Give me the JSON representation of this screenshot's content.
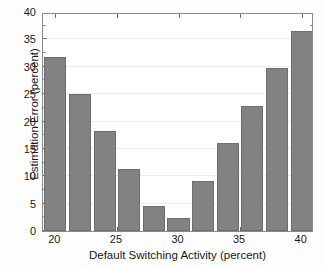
{
  "chart_data": {
    "type": "bar",
    "title": "",
    "xlabel": "Default Switching Activity (percent)",
    "ylabel": "Estimation Error (percent)",
    "x": [
      20,
      22,
      24,
      26,
      28,
      30,
      32,
      34,
      36,
      38,
      40
    ],
    "categories": [
      "20",
      "22",
      "24",
      "26",
      "28",
      "30",
      "32",
      "34",
      "36",
      "38",
      "40"
    ],
    "values": [
      31.8,
      25.0,
      18.3,
      11.4,
      4.6,
      2.4,
      9.2,
      16.1,
      22.9,
      29.7,
      36.5
    ],
    "xlim": [
      19,
      41
    ],
    "ylim": [
      0,
      40
    ],
    "xticks": [
      20,
      25,
      30,
      35,
      40
    ],
    "xtick_labels": [
      "20",
      "25",
      "30",
      "35",
      "40"
    ],
    "yticks": [
      0,
      5,
      10,
      15,
      20,
      25,
      30,
      35,
      40
    ],
    "ytick_labels": [
      "0",
      "5",
      "10",
      "15",
      "20",
      "25",
      "30",
      "35",
      "40"
    ],
    "grid": "horizontal",
    "legend": "none",
    "bar_color": "#828282",
    "bar_edge_color": "#6e6e6e",
    "grid_color": "#ececec",
    "axis_color": "#8a8a8a",
    "background": "#ffffff"
  }
}
